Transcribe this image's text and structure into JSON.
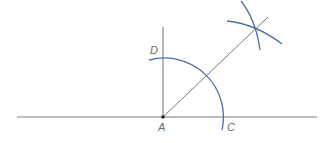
{
  "diagram": {
    "type": "geometric-construction-angle-bisector",
    "labels": {
      "A": "A",
      "C": "C",
      "D": "D"
    },
    "colors": {
      "line": "#6e6e6e",
      "arc": "#4a6fae",
      "point": "#222222"
    }
  }
}
